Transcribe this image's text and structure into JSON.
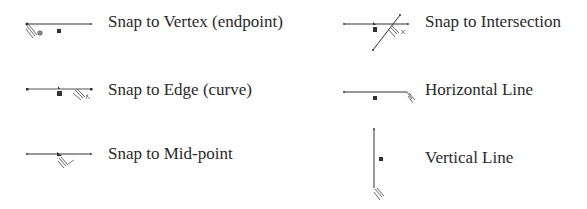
{
  "legend": {
    "items": [
      {
        "id": "vertex",
        "label": "Snap to Vertex (endpoint)",
        "icon": "snap-vertex-icon"
      },
      {
        "id": "edge",
        "label": "Snap to Edge (curve)",
        "icon": "snap-edge-icon"
      },
      {
        "id": "midpoint",
        "label": "Snap to Mid-point",
        "icon": "snap-midpoint-icon"
      },
      {
        "id": "intersection",
        "label": "Snap to Intersection",
        "icon": "snap-intersection-icon"
      },
      {
        "id": "horizontal",
        "label": "Horizontal Line",
        "icon": "horizontal-line-icon"
      },
      {
        "id": "vertical",
        "label": "Vertical Line",
        "icon": "vertical-line-icon"
      }
    ]
  },
  "colors": {
    "line": "#333333",
    "marker": "#333333",
    "text": "#2a2a2a",
    "background": "#ffffff"
  }
}
